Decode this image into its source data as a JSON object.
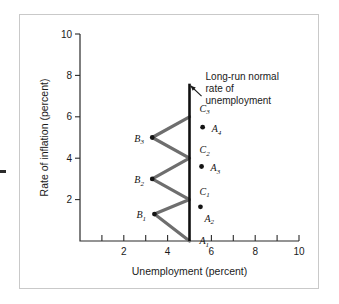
{
  "figure": {
    "kind": "phillips-curve-diagram",
    "frame_border_color": "#c9c9c9",
    "background_color": "#ffffff"
  },
  "chart_data": {
    "type": "line",
    "title": "",
    "xlabel": "Unemployment (percent)",
    "ylabel": "Rate of inflation (percent)",
    "xlim": [
      0,
      10
    ],
    "ylim": [
      0,
      10
    ],
    "xticks": [
      1,
      2,
      3,
      4,
      5,
      6,
      7,
      8,
      9,
      10
    ],
    "xtick_labels": [
      "",
      "2",
      "",
      "4",
      "",
      "6",
      "",
      "8",
      "",
      "10"
    ],
    "yticks": [
      2,
      4,
      6,
      8,
      10
    ],
    "ytick_labels": [
      "2",
      "4",
      "6",
      "8",
      "10"
    ],
    "grid": false,
    "legend": "none",
    "series": [
      {
        "name": "adjustment path",
        "type": "line",
        "color": "#6e6e6e",
        "points": [
          {
            "x": 5.0,
            "y": 0.0
          },
          {
            "x": 3.4,
            "y": 1.3
          },
          {
            "x": 5.0,
            "y": 2.0
          },
          {
            "x": 3.3,
            "y": 3.0
          },
          {
            "x": 5.0,
            "y": 4.0
          },
          {
            "x": 3.3,
            "y": 5.0
          },
          {
            "x": 5.0,
            "y": 6.0
          }
        ]
      },
      {
        "name": "long-run normal rate of unemployment",
        "type": "vline",
        "color": "#111111",
        "x": 5.0,
        "y_from": 0.0,
        "y_to": 7.6
      }
    ],
    "annotated_points": [
      {
        "label": "A",
        "sub": "1",
        "x": 5.0,
        "y": 0.0,
        "marker": false,
        "label_dx": 10,
        "label_dy": 3
      },
      {
        "label": "B",
        "sub": "1",
        "x": 3.4,
        "y": 1.3,
        "marker": true,
        "label_dx": -18,
        "label_dy": 4
      },
      {
        "label": "A",
        "sub": "2",
        "x": 5.5,
        "y": 1.65,
        "marker": true,
        "label_dx": 4,
        "label_dy": 15
      },
      {
        "label": "C",
        "sub": "1",
        "x": 5.0,
        "y": 2.0,
        "marker": false,
        "label_dx": 10,
        "label_dy": -5
      },
      {
        "label": "B",
        "sub": "2",
        "x": 3.3,
        "y": 3.0,
        "marker": true,
        "label_dx": -18,
        "label_dy": 4
      },
      {
        "label": "A",
        "sub": "3",
        "x": 5.55,
        "y": 3.6,
        "marker": true,
        "label_dx": 9,
        "label_dy": 5
      },
      {
        "label": "C",
        "sub": "2",
        "x": 5.0,
        "y": 4.0,
        "marker": false,
        "label_dx": 10,
        "label_dy": -5
      },
      {
        "label": "B",
        "sub": "3",
        "x": 3.3,
        "y": 5.0,
        "marker": true,
        "label_dx": -18,
        "label_dy": 4
      },
      {
        "label": "A",
        "sub": "4",
        "x": 5.6,
        "y": 5.5,
        "marker": true,
        "label_dx": 9,
        "label_dy": 5
      },
      {
        "label": "C",
        "sub": "3",
        "x": 5.0,
        "y": 6.0,
        "marker": false,
        "label_dx": 10,
        "label_dy": -5
      }
    ],
    "annotations": [
      {
        "name": "long-run-normal-rate-callout",
        "lines": [
          "Long-run normal",
          "rate of",
          "unemployment"
        ],
        "arrow_from": {
          "x": 5.55,
          "y": 7.0
        },
        "arrow_to": {
          "x": 5.05,
          "y": 7.5
        }
      }
    ]
  }
}
